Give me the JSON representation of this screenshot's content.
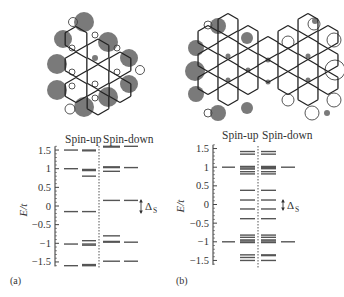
{
  "figure": {
    "panels": [
      {
        "id": "a",
        "label": "(a)",
        "molecule": "triangular graphene nanoflake (spin density: filled = spin-up, open = spin-down)",
        "column_headers": {
          "spin_up": "Spin-up",
          "spin_down": "Spin-down"
        },
        "ylabel": "E/t",
        "gap_label": "Δ",
        "gap_subscript": "S",
        "y_ticks": [
          "1.5",
          "1",
          "0.5",
          "0",
          "−0.5",
          "−1",
          "−1.5"
        ]
      },
      {
        "id": "b",
        "label": "(b)",
        "molecule": "bowtie graphene nanoflake (spin density: filled = spin-up, open = spin-down)",
        "column_headers": {
          "spin_up": "Spin-up",
          "spin_down": "Spin-down"
        },
        "ylabel": "E/t",
        "gap_label": "Δ",
        "gap_subscript": "S",
        "y_ticks": [
          "1.5",
          "1",
          "0.5",
          "0",
          "−0.5",
          "−1",
          "−1.5"
        ]
      }
    ]
  },
  "chart_data": [
    {
      "type": "energy-level diagram",
      "title": "(a)",
      "ylabel": "E/t",
      "ylim": [
        -1.6,
        1.6
      ],
      "y_ticks": [
        1.5,
        1,
        0.5,
        0,
        -0.5,
        -1,
        -1.5
      ],
      "series": [
        {
          "name": "Spin-up (single site)",
          "values": [
            1.5,
            1.0,
            -0.15,
            -1.02,
            -1.6
          ]
        },
        {
          "name": "Spin-up (flake)",
          "values": [
            1.5,
            1.48,
            0.98,
            0.95,
            0.8,
            -0.15,
            -0.93,
            -1.02,
            -1.05,
            -1.57,
            -1.6
          ]
        },
        {
          "name": "Spin-down (flake)",
          "values": [
            1.6,
            1.58,
            1.05,
            1.03,
            0.93,
            0.15,
            -0.8,
            -0.95,
            -0.97,
            -1.48
          ]
        },
        {
          "name": "Spin-down (single site)",
          "values": [
            1.6,
            1.03,
            0.15,
            -0.97,
            -1.48
          ]
        }
      ],
      "annotations": [
        "Δ_S gap around E = 0"
      ]
    },
    {
      "type": "energy-level diagram",
      "title": "(b)",
      "ylabel": "E/t",
      "ylim": [
        -1.6,
        1.6
      ],
      "y_ticks": [
        1.5,
        1,
        0.5,
        0,
        -0.5,
        -1,
        -1.5
      ],
      "series": [
        {
          "name": "Spin-up (single site)",
          "values": [
            1.0,
            -1.0
          ]
        },
        {
          "name": "Spin-up (flake)",
          "values": [
            1.42,
            1.35,
            1.02,
            0.98,
            0.95,
            0.88,
            0.82,
            0.38,
            0.12,
            -0.12,
            -0.38,
            -0.82,
            -0.88,
            -0.95,
            -0.98,
            -1.02,
            -1.35,
            -1.42,
            -1.5
          ]
        },
        {
          "name": "Spin-down (flake)",
          "values": [
            1.42,
            1.35,
            1.02,
            0.99,
            0.96,
            0.88,
            0.82,
            0.38,
            0.12,
            -0.12,
            -0.38,
            -0.82,
            -0.88,
            -0.95,
            -0.98,
            -1.02,
            -1.35,
            -1.37,
            -1.5
          ]
        },
        {
          "name": "Spin-down (single site)",
          "values": [
            1.0,
            -1.0
          ]
        }
      ],
      "annotations": [
        "Δ_S gap around E = 0"
      ]
    }
  ]
}
